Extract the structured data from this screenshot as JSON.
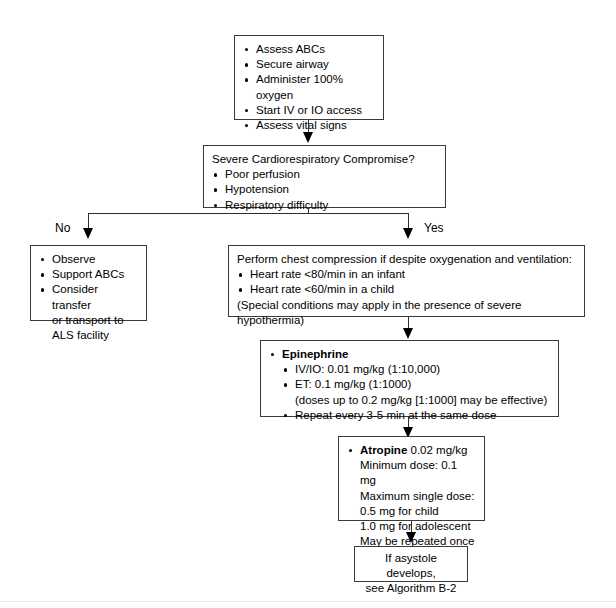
{
  "diagram": {
    "accent_color": "#000000",
    "box_border_color": "#3a3a3a",
    "background_color": "#ffffff"
  },
  "nodes": {
    "initial_assessment": {
      "items": [
        "Assess ABCs",
        "Secure airway",
        "Administer 100% oxygen",
        "Start IV or IO access",
        "Assess vital signs"
      ]
    },
    "decision": {
      "heading": "Severe Cardiorespiratory Compromise?",
      "items": [
        "Poor perfusion",
        "Hypotension",
        "Respiratory difficulty"
      ]
    },
    "no_branch": {
      "items": [
        "Observe",
        "Support ABCs",
        "Consider transfer"
      ],
      "continuation": [
        "or transport to",
        "ALS facility"
      ]
    },
    "chest_compression": {
      "heading": "Perform chest compression if despite oxygenation and ventilation:",
      "items": [
        "Heart rate <80/min in an infant",
        "Heart rate <60/min in a child"
      ],
      "footnote": "(Special conditions may apply in the presence of severe hypothermia)"
    },
    "epinephrine": {
      "drug": "Epinephrine",
      "items": [
        "IV/IO: 0.01 mg/kg (1:10,000)",
        "ET: 0.1 mg/kg (1:1000)"
      ],
      "note": "(doses up to 0.2 mg/kg [1:1000] may be effective)",
      "repeat": "Repeat every 3-5 min at the same dose"
    },
    "atropine": {
      "drug": "Atropine",
      "dose": "0.02 mg/kg",
      "lines": [
        "Minimum dose: 0.1 mg",
        "Maximum single dose:"
      ],
      "sub_lines": [
        "0.5 mg for child",
        "1.0 mg for adolescent"
      ],
      "final_line": "May be repeated once"
    },
    "asystole": {
      "lines": [
        "If asystole develops,",
        "see Algorithm B-2"
      ]
    }
  },
  "branches": {
    "no_label": "No",
    "yes_label": "Yes"
  }
}
